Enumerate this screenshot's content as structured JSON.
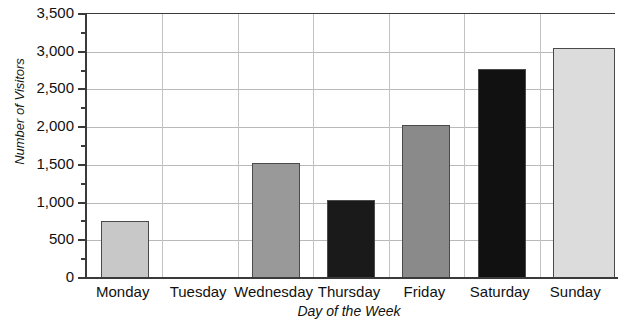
{
  "chart_data": {
    "type": "bar",
    "title": "",
    "xlabel": "Day of the Week",
    "ylabel": "Number of Visitors",
    "categories": [
      "Monday",
      "Tuesday",
      "Wednesday",
      "Thursday",
      "Friday",
      "Saturday",
      "Sunday"
    ],
    "values": [
      760,
      0,
      1520,
      1030,
      2030,
      2770,
      3050
    ],
    "bar_colors": [
      "#c8c8c8",
      "none",
      "#999999",
      "#1a1a1a",
      "#8a8a8a",
      "#111111",
      "#dcdcdc"
    ],
    "ylim": [
      0,
      3500
    ],
    "ytick_labels": [
      "0",
      "500",
      "1,000",
      "1,500",
      "2,000",
      "2,500",
      "3,000",
      "3,500"
    ],
    "ytick_values": [
      0,
      500,
      1000,
      1500,
      2000,
      2500,
      3000,
      3500
    ],
    "yminor_values": [
      250,
      750,
      1250,
      1750,
      2250,
      2750,
      3250
    ],
    "grid": "horizontal-and-vertical",
    "legend": "none"
  },
  "axes": {
    "y_title": "Number of Visitors",
    "x_title": "Day of the Week"
  },
  "labels": {
    "y": [
      "3,500",
      "3,000",
      "2,500",
      "2,000",
      "1,500",
      "1,000",
      "500",
      "0"
    ],
    "x": [
      "Monday",
      "Tuesday",
      "Wednesday",
      "Thursday",
      "Friday",
      "Saturday",
      "Sunday"
    ]
  }
}
